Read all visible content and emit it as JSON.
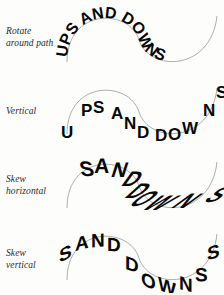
{
  "figure": {
    "sample_text": "UPS AND DOWNS",
    "background_color": "#fdfdfb",
    "text_color": "#080808",
    "path_color": "#8d8d8d",
    "path_shape": "s-curve",
    "rows": [
      {
        "label": "Rotate\naround path",
        "effect": "rotate-around-path",
        "text": "UPS AND DOWNS",
        "description": "Letters rotate so their baseline is tangent to the curve"
      },
      {
        "label": "Vertical",
        "effect": "vertical",
        "text": "UPS AND DOWNS",
        "description": "Letters stay upright while the baseline follows the curve"
      },
      {
        "label": "Skew\nhorizontal",
        "effect": "skew-horizontal",
        "text": "S AND DOWNS",
        "description": "Letters are sheared horizontally along the curve"
      },
      {
        "label": "Skew\nvertical",
        "effect": "skew-vertical",
        "text": "S AND DOWNS",
        "description": "Letters are sheared vertically along the curve"
      }
    ]
  }
}
